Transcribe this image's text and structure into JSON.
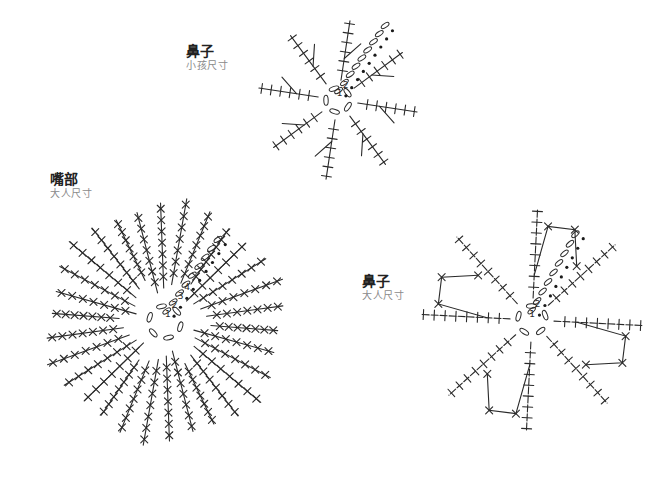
{
  "labels": {
    "nose_child": {
      "title": "鼻子",
      "subtitle": "小孩尺寸"
    },
    "mouth_adult": {
      "title": "嘴部",
      "subtitle": "大人尺寸"
    },
    "nose_adult": {
      "title": "鼻子",
      "subtitle": "大人尺寸"
    }
  },
  "charts": [
    {
      "id": "nose-child",
      "center": [
        338,
        100
      ],
      "spokes": 8,
      "rounds": 2,
      "round_numbers": [
        "1",
        "2"
      ],
      "spoke_length": 80,
      "stitches_per_spoke": 6,
      "style": "spoke-branches"
    },
    {
      "id": "mouth-adult",
      "center": [
        165,
        322
      ],
      "spokes": 6,
      "rounds": 4,
      "round_numbers": [
        "1",
        "2",
        "3",
        "4"
      ],
      "spoke_length": 125,
      "rows_per_wedge": 5,
      "style": "filled-wedges"
    },
    {
      "id": "nose-adult",
      "center": [
        532,
        320
      ],
      "spokes": 8,
      "rounds": 2,
      "round_numbers": [
        "1",
        "2"
      ],
      "spoke_length": 112,
      "stitches_per_spoke": 8,
      "style": "spoke-loops"
    }
  ],
  "symbols": {
    "single-crochet": "×",
    "chain": "oval",
    "slip-stitch": "dot"
  }
}
